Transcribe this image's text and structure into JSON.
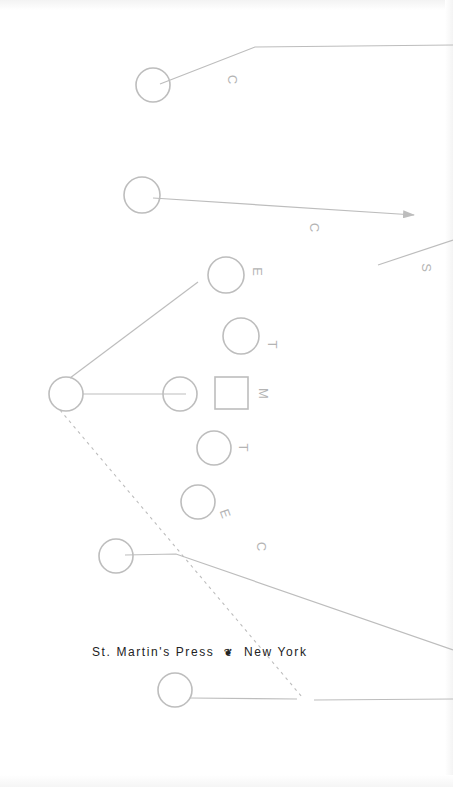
{
  "page": {
    "type": "book title page (rotated diagram)",
    "background": "#ffffff",
    "stroke_color": "#bdbdbd",
    "text_color": "#222222"
  },
  "diagram": {
    "labels": [
      {
        "id": "c1",
        "text": "C"
      },
      {
        "id": "c2",
        "text": "C"
      },
      {
        "id": "s1",
        "text": "S"
      },
      {
        "id": "e1",
        "text": "E"
      },
      {
        "id": "t1",
        "text": "T"
      },
      {
        "id": "m1",
        "text": "M"
      },
      {
        "id": "t2",
        "text": "T"
      },
      {
        "id": "e2",
        "text": "E"
      },
      {
        "id": "c3",
        "text": "C"
      }
    ],
    "nodes": [
      {
        "shape": "circle",
        "cx": 153,
        "cy": 85
      },
      {
        "shape": "circle",
        "cx": 142,
        "cy": 195
      },
      {
        "shape": "circle",
        "cx": 226,
        "cy": 275
      },
      {
        "shape": "circle",
        "cx": 241,
        "cy": 336
      },
      {
        "shape": "circle",
        "cx": 66,
        "cy": 394
      },
      {
        "shape": "circle",
        "cx": 180,
        "cy": 394
      },
      {
        "shape": "square",
        "x": 215,
        "y": 377
      },
      {
        "shape": "circle",
        "cx": 214,
        "cy": 448
      },
      {
        "shape": "circle",
        "cx": 198,
        "cy": 502
      },
      {
        "shape": "circle",
        "cx": 116,
        "cy": 556
      },
      {
        "shape": "circle",
        "cx": 175,
        "cy": 690
      }
    ]
  },
  "imprint": {
    "publisher": "St. Martin's Press",
    "separator_icon": "publisher-logo-icon",
    "separator_glyph": "❦",
    "city": "New York"
  }
}
